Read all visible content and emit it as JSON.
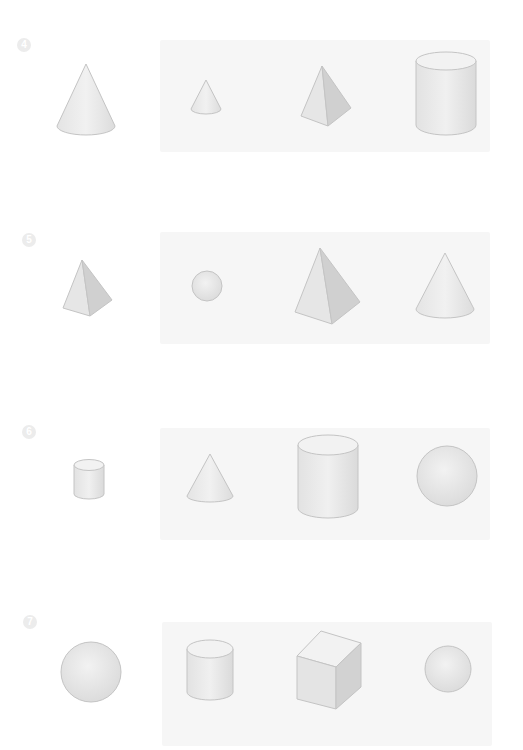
{
  "rows": [
    {
      "number": "4",
      "reference_shape": "cone",
      "options": [
        "small-cone",
        "pyramid",
        "cylinder"
      ]
    },
    {
      "number": "5",
      "reference_shape": "pyramid",
      "options": [
        "sphere",
        "large-pyramid",
        "cone"
      ]
    },
    {
      "number": "6",
      "reference_shape": "small-cylinder",
      "options": [
        "cone",
        "large-cylinder",
        "sphere"
      ]
    },
    {
      "number": "7",
      "reference_shape": "sphere",
      "options": [
        "cylinder",
        "cube",
        "small-sphere"
      ]
    }
  ],
  "colors": {
    "shape_fill": "#e6e6e6",
    "shape_shade": "#d2d2d2",
    "shape_stroke": "#bdbdbd",
    "panel": "#f6f6f6",
    "number_badge": "#ececec"
  }
}
